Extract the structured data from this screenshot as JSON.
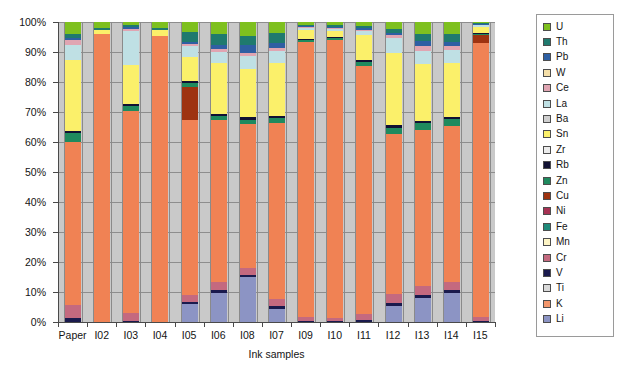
{
  "chart_data": {
    "type": "bar",
    "subtype": "100% stacked column",
    "title": "",
    "xlabel": "Ink samples",
    "ylabel": "",
    "ylim": [
      0,
      100
    ],
    "ytick_labels": [
      "0%",
      "10%",
      "20%",
      "30%",
      "40%",
      "50%",
      "60%",
      "70%",
      "80%",
      "90%",
      "100%"
    ],
    "ytick_values": [
      0,
      10,
      20,
      30,
      40,
      50,
      60,
      70,
      80,
      90,
      100
    ],
    "grid": true,
    "legend_position": "right",
    "plot_background": "#c9c9c9",
    "categories": [
      "Paper",
      "I02",
      "I03",
      "I04",
      "I05",
      "I06",
      "I08",
      "I07",
      "I09",
      "I10",
      "I11",
      "I12",
      "I13",
      "I14",
      "I15"
    ],
    "series": [
      {
        "name": "Li",
        "color": "#8c94c4",
        "values": [
          0,
          0,
          0,
          0,
          6.0,
          9.7,
          15.1,
          4.5,
          0,
          0,
          0,
          5.3,
          8.0,
          9.6,
          0
        ]
      },
      {
        "name": "K",
        "color": "#f2966b",
        "values": [
          0,
          0,
          0,
          0,
          0,
          0,
          0,
          0,
          0,
          0,
          0,
          0,
          0,
          0,
          0
        ]
      },
      {
        "name": "Ti",
        "color": "#d9d9d9",
        "values": [
          0,
          0,
          0,
          0,
          0,
          0,
          0,
          0,
          0,
          0,
          0,
          0,
          0,
          0,
          0
        ]
      },
      {
        "name": "V",
        "color": "#1a1a4d",
        "values": [
          1.2,
          0,
          0.5,
          0,
          0.6,
          0.9,
          0.7,
          0.8,
          0.5,
          0.4,
          0.6,
          1.0,
          0.9,
          1.0,
          0.4
        ]
      },
      {
        "name": "Cr",
        "color": "#c4697f",
        "values": [
          4.5,
          0,
          2.5,
          0,
          2.4,
          2.6,
          2.2,
          2.3,
          1.3,
          1.0,
          2.1,
          3.0,
          3.1,
          2.9,
          1.4
        ]
      },
      {
        "name": "Mn",
        "color": "#fdf4c4",
        "values": [
          0,
          0,
          0,
          0,
          0,
          0,
          0,
          0,
          0,
          0,
          0,
          0,
          0,
          0,
          0
        ]
      },
      {
        "name": "Fe",
        "color": "#f08254",
        "values": [
          54.3,
          95.9,
          67.5,
          95.5,
          58.2,
          54.0,
          48.0,
          58.6,
          91.7,
          92.7,
          82.8,
          53.5,
          52.0,
          51.8,
          91.2
        ]
      },
      {
        "name": "Ni",
        "color": "#a63253",
        "values": [
          0,
          0,
          0,
          0,
          0,
          0,
          0,
          0,
          0,
          0,
          0,
          0,
          0,
          0,
          0
        ]
      },
      {
        "name": "Cu",
        "color": "#9e3310",
        "values": [
          0,
          0,
          0,
          0,
          11.2,
          0,
          0,
          0,
          0,
          0,
          0,
          0,
          0,
          0,
          2.6
        ]
      },
      {
        "name": "Zn",
        "color": "#1f8a5e",
        "values": [
          2.9,
          0,
          1.5,
          0,
          1.4,
          1.6,
          1.5,
          1.9,
          0.6,
          0.5,
          1.2,
          2.0,
          2.2,
          2.3,
          0.6
        ]
      },
      {
        "name": "Rb",
        "color": "#111133",
        "values": [
          0.9,
          0,
          0.7,
          0,
          0.6,
          0.7,
          0.7,
          0.7,
          0.4,
          0.3,
          0.5,
          0.8,
          0.8,
          0.8,
          0.3
        ]
      },
      {
        "name": "Zr",
        "color": "#ececec",
        "values": [
          0,
          0,
          0,
          0,
          0,
          0,
          0,
          0,
          0,
          0,
          0,
          0,
          0,
          0,
          0
        ]
      },
      {
        "name": "Sn",
        "color": "#fbf06a",
        "values": [
          23.5,
          1.4,
          13.0,
          1.7,
          8.0,
          17.0,
          16.3,
          17.5,
          3.0,
          2.2,
          8.5,
          24.0,
          19.0,
          18.0,
          2.0
        ]
      },
      {
        "name": "Ba",
        "color": "#cfcfcf",
        "values": [
          0,
          0,
          0,
          0,
          0,
          0,
          0,
          0,
          0,
          0,
          0,
          0,
          0,
          0,
          0
        ]
      },
      {
        "name": "La",
        "color": "#bfe0e4",
        "values": [
          5.0,
          0,
          11.3,
          0,
          3.5,
          3.6,
          4.2,
          4.0,
          0.5,
          0.6,
          1.2,
          5.0,
          4.5,
          4.3,
          0.4
        ]
      },
      {
        "name": "Ce",
        "color": "#e0a5b2",
        "values": [
          1.8,
          0,
          0.8,
          0,
          0.9,
          1.0,
          1.1,
          1.0,
          0.3,
          0.3,
          0.6,
          1.1,
          1.4,
          1.2,
          0.3
        ]
      },
      {
        "name": "W",
        "color": "#f5dfa8",
        "values": [
          0,
          0,
          0,
          0,
          0,
          0,
          0,
          0,
          0,
          0,
          0,
          0,
          0,
          0,
          0
        ]
      },
      {
        "name": "Pb",
        "color": "#2e5fa3",
        "values": [
          0.6,
          0,
          0.4,
          0,
          0.5,
          1.4,
          2.6,
          1.6,
          0.3,
          0.3,
          0.4,
          0.7,
          1.8,
          1.5,
          0.3
        ]
      },
      {
        "name": "Th",
        "color": "#1f7a6e",
        "values": [
          1.3,
          0.7,
          0.8,
          0.8,
          3.4,
          3.6,
          3.0,
          3.5,
          0.5,
          0.8,
          0.9,
          1.2,
          2.3,
          2.5,
          0.3
        ]
      },
      {
        "name": "U",
        "color": "#7ec01f",
        "values": [
          4.0,
          2.0,
          1.0,
          2.0,
          3.3,
          3.9,
          4.6,
          3.6,
          0.9,
          0.9,
          1.2,
          2.4,
          4.0,
          4.1,
          0.2
        ]
      }
    ]
  },
  "legend": {
    "items": [
      {
        "label": "U",
        "color": "#7ec01f"
      },
      {
        "label": "Th",
        "color": "#1f7a6e"
      },
      {
        "label": "Pb",
        "color": "#2e5fa3"
      },
      {
        "label": "W",
        "color": "#f5dfa8"
      },
      {
        "label": "Ce",
        "color": "#e0a5b2"
      },
      {
        "label": "La",
        "color": "#bfe0e4"
      },
      {
        "label": "Ba",
        "color": "#cfcfcf"
      },
      {
        "label": "Sn",
        "color": "#fbf06a"
      },
      {
        "label": "Zr",
        "color": "#ececec"
      },
      {
        "label": "Rb",
        "color": "#111133"
      },
      {
        "label": "Zn",
        "color": "#1f8a5e"
      },
      {
        "label": "Cu",
        "color": "#9e3310"
      },
      {
        "label": "Ni",
        "color": "#a63253"
      },
      {
        "label": "Fe",
        "color": "#1f8a7a"
      },
      {
        "label": "Mn",
        "color": "#fdf4c4"
      },
      {
        "label": "Cr",
        "color": "#c4697f"
      },
      {
        "label": "V",
        "color": "#1a1a4d"
      },
      {
        "label": "Ti",
        "color": "#d9d9d9"
      },
      {
        "label": "K",
        "color": "#f2966b"
      },
      {
        "label": "Li",
        "color": "#8c94c4"
      }
    ]
  }
}
